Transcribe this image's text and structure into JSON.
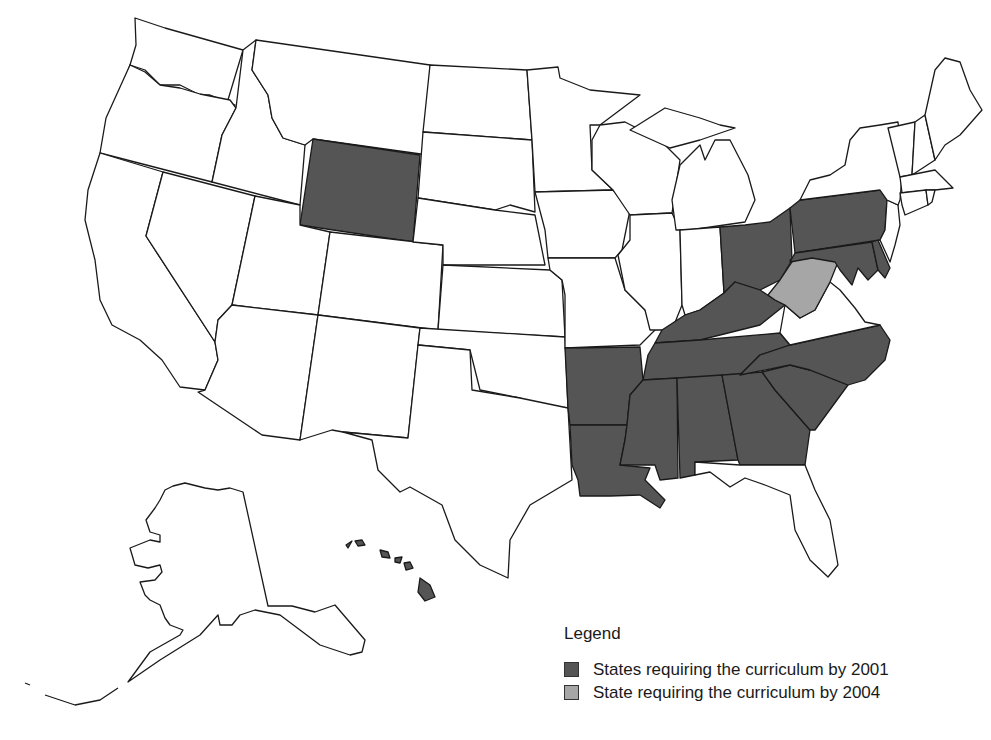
{
  "map": {
    "title": "",
    "region": "United States",
    "colors": {
      "required_2001": "#555555",
      "required_2004": "#a6a6a6",
      "not_required": "#ffffff",
      "border": "#1a1a1a"
    },
    "states_required_2001": [
      "Wyoming",
      "Ohio",
      "Pennsylvania",
      "Maryland",
      "Delaware",
      "Kentucky",
      "Tennessee",
      "North Carolina",
      "South Carolina",
      "Georgia",
      "Alabama",
      "Mississippi",
      "Louisiana",
      "Arkansas",
      "Hawaii"
    ],
    "states_required_2004": [
      "West Virginia"
    ]
  },
  "legend": {
    "title": "Legend",
    "items": [
      {
        "label": "States requiring the curriculum by 2001",
        "color": "#555555"
      },
      {
        "label": "State requiring the curriculum by 2004",
        "color": "#a6a6a6"
      }
    ]
  }
}
